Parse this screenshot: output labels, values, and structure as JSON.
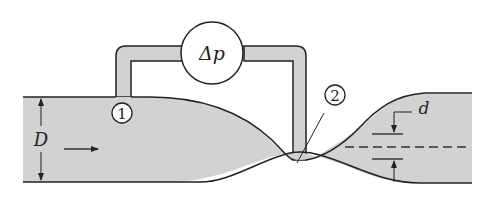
{
  "figure": {
    "colors": {
      "fluid_fill": "#d2d2d2",
      "outline": "#222222",
      "background": "#ffffff"
    },
    "labels": {
      "gauge": "Δp",
      "station_1": "1",
      "station_2": "2",
      "pipe_diameter": "D",
      "throat_diameter": "d"
    },
    "annotations": {
      "flow_direction": "left-to-right arrow",
      "centerline": "dashed line through throat region"
    }
  }
}
